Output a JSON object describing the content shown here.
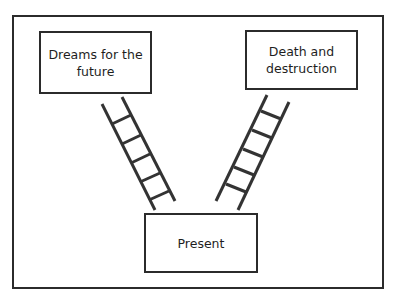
{
  "diagram": {
    "boxes": {
      "future": {
        "label": "Dreams for the future"
      },
      "death": {
        "label": "Death and destruction"
      },
      "present": {
        "label": "Present"
      }
    },
    "ladders": [
      {
        "name": "ladder-to-future",
        "rungs": 5
      },
      {
        "name": "ladder-to-death",
        "rungs": 6
      }
    ],
    "colors": {
      "stroke": "#2b2b2b",
      "background": "#ffffff"
    }
  }
}
